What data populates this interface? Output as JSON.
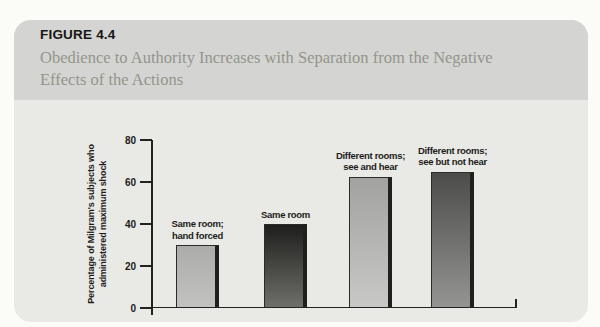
{
  "figure": {
    "label": "FIGURE 4.4",
    "caption": "Obedience to Authority Increases with Separation from the Negative Effects of the Actions",
    "caption_lines": [
      "Obedience to Authority Increases with Separation from the Negative",
      "Effects of the Actions"
    ]
  },
  "chart_data": {
    "type": "bar",
    "categories": [
      "Same room; hand forced",
      "Same room",
      "Different rooms; see and hear",
      "Different rooms; see but not hear"
    ],
    "values": [
      30,
      40,
      62.5,
      65
    ],
    "title": "",
    "xlabel": "",
    "ylabel": "Percentage of Milgram's subjects who administered maximum shock",
    "ylabel_lines": [
      "Percentage of Milgram's subjects who",
      "administered maximum shock"
    ],
    "ylim": [
      0,
      80
    ],
    "yticks": [
      0,
      20,
      40,
      60,
      80
    ],
    "grid": false,
    "legend": false,
    "bar_colors": [
      {
        "top": "#acacaa",
        "bottom": "#c2c2c0"
      },
      {
        "top": "#1e1e1c",
        "bottom": "#6e6e6a"
      },
      {
        "top": "#a2a2a0",
        "bottom": "#c8c8c6"
      },
      {
        "top": "#4c4c4a",
        "bottom": "#949492"
      }
    ],
    "layout": {
      "bar_lefts": [
        24,
        112,
        197,
        279
      ],
      "bar_width": 43,
      "px_per_unit": 2.1,
      "label_gap": 4
    }
  },
  "colors": {
    "page_bg": "#fbfbf8",
    "card_header": "#d4d4d2",
    "card_body": "#e9e9e6",
    "axis": "#222220",
    "title_text": "#161616",
    "caption_text": "#95948c",
    "label_text": "#1c1c1a"
  }
}
